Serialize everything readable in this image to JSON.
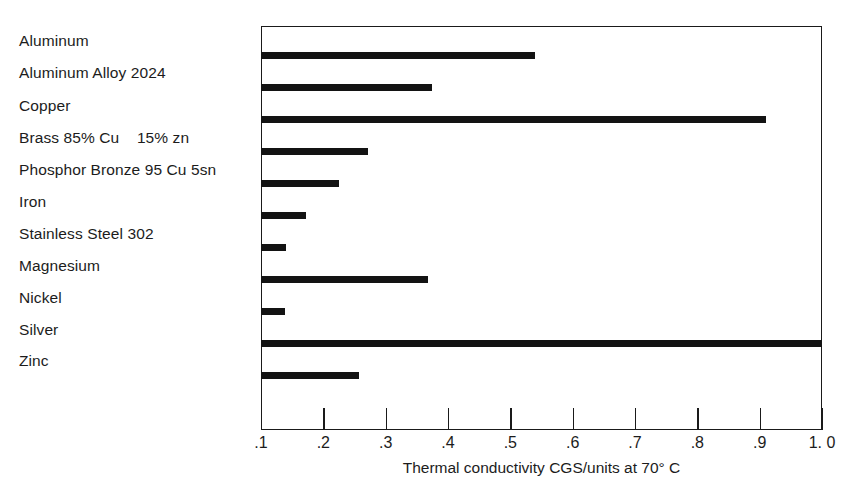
{
  "chart_data": {
    "type": "bar",
    "orientation": "horizontal",
    "title": "",
    "xlabel": "Thermal conductivity CGS/units at 70° C",
    "ylabel": "",
    "xlim": [
      0.1,
      1.0
    ],
    "grid": false,
    "legend": null,
    "xticks": [
      0.1,
      0.2,
      0.3,
      0.4,
      0.5,
      0.6,
      0.7,
      0.8,
      0.9,
      1.0
    ],
    "xticklabels": [
      ".1",
      ".2",
      ".3",
      ".4",
      ".5",
      ".6",
      ".7",
      ".8",
      ".9",
      "1. 0"
    ],
    "categories": [
      "Aluminum",
      "Aluminum Alloy 2024",
      "Copper",
      "Brass 85% Cu    15% zn",
      "Phosphor Bronze 95 Cu 5sn",
      "Iron",
      "Stainless Steel 302",
      "Magnesium",
      "Nickel",
      "Silver",
      "Zinc"
    ],
    "values": [
      0.54,
      0.375,
      0.91,
      0.272,
      0.225,
      0.172,
      0.14,
      0.368,
      0.138,
      1.0,
      0.257
    ],
    "series": [
      {
        "name": "Thermal conductivity",
        "values": [
          0.54,
          0.375,
          0.91,
          0.272,
          0.225,
          0.172,
          0.14,
          0.368,
          0.138,
          1.0,
          0.257
        ]
      }
    ],
    "bar_color": "#131313",
    "axis_color": "#1a1a1a",
    "background": "#ffffff"
  }
}
